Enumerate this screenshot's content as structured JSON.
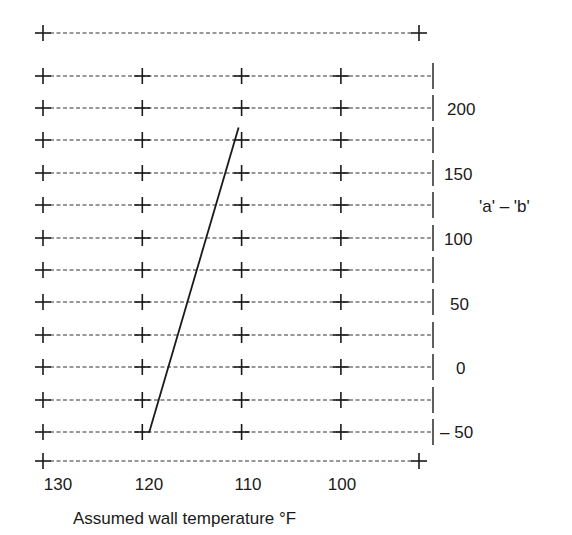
{
  "chart_data": {
    "type": "line",
    "title": "",
    "xlabel": "Assumed wall temperature °F",
    "ylabel": "'a' – 'b'",
    "x_ticks": [
      130,
      120,
      110,
      100
    ],
    "x_tick_labels": [
      "130",
      "120",
      "110",
      "100"
    ],
    "y_ticks": [
      200,
      150,
      100,
      50,
      0,
      -50
    ],
    "y_tick_labels": [
      "200",
      "150",
      "100",
      "50",
      "0",
      "– 50"
    ],
    "xlim": [
      130,
      96
    ],
    "ylim": [
      -50,
      225
    ],
    "x_axis_reversed": true,
    "grid": true,
    "grid_style": "dashed rows with + markers at tick columns",
    "legend": null,
    "series": [
      {
        "name": "'a' – 'b' vs wall temperature",
        "points": [
          {
            "x": 119.3,
            "y": -50
          },
          {
            "x": 110.3,
            "y": 185
          }
        ]
      }
    ]
  },
  "labels": {
    "x_title": "Assumed wall temperature °F",
    "y_title": "'a' – 'b'",
    "x_ticks": [
      "130",
      "120",
      "110",
      "100"
    ],
    "y_ticks": [
      "200",
      "150",
      "100",
      "50",
      "0",
      "– 50"
    ]
  }
}
